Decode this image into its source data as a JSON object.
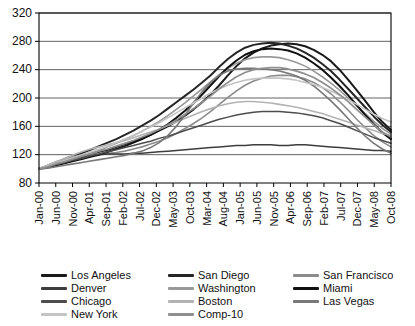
{
  "chart_data": {
    "type": "line",
    "title": "",
    "subtitle": "",
    "xlabel": "",
    "ylabel": "",
    "ylim": [
      80,
      320
    ],
    "ytick_step": 40,
    "yticks": [
      80,
      120,
      160,
      200,
      240,
      280,
      320
    ],
    "grid": true,
    "grid_axis": "y",
    "legend_position": "bottom",
    "legend_columns": 3,
    "x_tick_interval_months": 5,
    "x_start": "Jan-00",
    "x_end": "Oct-08",
    "xticks": [
      "Jan-00",
      "Jun-00",
      "Nov-00",
      "Apr-01",
      "Sep-01",
      "Feb-02",
      "Jul-02",
      "Dec-02",
      "May-03",
      "Oct-03",
      "Mar-04",
      "Aug-04",
      "Jan-05",
      "Jun-05",
      "Nov-05",
      "Apr-06",
      "Sep-06",
      "Feb-07",
      "Jul-07",
      "Dec-07",
      "May-08",
      "Oct-08"
    ],
    "series": [
      {
        "name": "Los Angeles",
        "color": "#1a1a1a",
        "width": 2.0,
        "values": [
          100,
          103,
          106,
          109,
          113,
          117,
          121,
          124,
          127,
          131,
          135,
          139,
          143,
          148,
          154,
          160,
          167,
          175,
          184,
          194,
          205,
          218,
          232,
          245,
          256,
          264,
          270,
          274,
          276,
          277,
          276,
          273,
          268,
          261,
          252,
          240,
          226,
          211,
          196,
          180,
          166,
          155
        ]
      },
      {
        "name": "San Diego",
        "color": "#262626",
        "width": 2.0,
        "values": [
          100,
          104,
          108,
          112,
          117,
          122,
          127,
          132,
          137,
          142,
          148,
          154,
          161,
          168,
          176,
          185,
          194,
          203,
          212,
          222,
          232,
          244,
          255,
          264,
          271,
          275,
          277,
          278,
          277,
          274,
          270,
          264,
          257,
          248,
          238,
          226,
          213,
          200,
          187,
          174,
          162,
          152
        ]
      },
      {
        "name": "San Francisco",
        "color": "#8c8c8c",
        "width": 1.6,
        "values": [
          100,
          105,
          110,
          114,
          117,
          119,
          120,
          121,
          122,
          123,
          125,
          128,
          131,
          135,
          139,
          144,
          150,
          157,
          164,
          172,
          181,
          191,
          201,
          210,
          218,
          224,
          228,
          231,
          232,
          232,
          230,
          227,
          222,
          215,
          206,
          195,
          183,
          170,
          158,
          147,
          138,
          131
        ]
      },
      {
        "name": "Denver",
        "color": "#3d3d3d",
        "width": 1.5,
        "values": [
          100,
          104,
          108,
          111,
          114,
          117,
          119,
          120,
          121,
          121,
          121,
          122,
          122,
          123,
          124,
          125,
          126,
          127,
          128,
          129,
          130,
          131,
          132,
          133,
          133,
          134,
          134,
          134,
          133,
          133,
          134,
          134,
          133,
          132,
          131,
          130,
          129,
          128,
          127,
          126,
          126,
          125
        ]
      },
      {
        "name": "Washington",
        "color": "#999999",
        "width": 1.6,
        "values": [
          100,
          103,
          106,
          110,
          114,
          118,
          122,
          126,
          131,
          136,
          141,
          147,
          153,
          160,
          167,
          175,
          184,
          193,
          203,
          213,
          223,
          233,
          242,
          249,
          254,
          257,
          258,
          258,
          257,
          254,
          250,
          245,
          238,
          230,
          221,
          211,
          200,
          189,
          178,
          167,
          157,
          149
        ]
      },
      {
        "name": "Miami",
        "color": "#111111",
        "width": 2.0,
        "values": [
          100,
          102,
          105,
          108,
          111,
          114,
          117,
          120,
          124,
          128,
          132,
          137,
          142,
          148,
          155,
          163,
          172,
          182,
          193,
          205,
          218,
          231,
          243,
          253,
          261,
          266,
          269,
          270,
          269,
          267,
          263,
          257,
          249,
          240,
          229,
          217,
          204,
          190,
          176,
          163,
          151,
          142
        ]
      },
      {
        "name": "Chicago",
        "color": "#4d4d4d",
        "width": 1.5,
        "values": [
          100,
          103,
          106,
          109,
          112,
          115,
          118,
          121,
          124,
          127,
          130,
          133,
          136,
          139,
          143,
          146,
          150,
          154,
          158,
          162,
          166,
          170,
          173,
          176,
          178,
          180,
          181,
          181,
          181,
          180,
          179,
          177,
          175,
          172,
          168,
          164,
          159,
          154,
          149,
          144,
          140,
          136
        ]
      },
      {
        "name": "Boston",
        "color": "#b3b3b3",
        "width": 1.6,
        "values": [
          100,
          105,
          110,
          115,
          120,
          124,
          128,
          131,
          134,
          137,
          140,
          144,
          148,
          152,
          156,
          161,
          166,
          171,
          176,
          181,
          185,
          189,
          192,
          194,
          195,
          195,
          194,
          193,
          191,
          189,
          187,
          184,
          181,
          178,
          174,
          170,
          166,
          162,
          158,
          154,
          150,
          147
        ]
      },
      {
        "name": "Las Vegas",
        "color": "#787878",
        "width": 1.6,
        "values": [
          100,
          101,
          103,
          105,
          107,
          109,
          111,
          113,
          115,
          117,
          119,
          122,
          125,
          130,
          137,
          147,
          160,
          176,
          193,
          209,
          222,
          232,
          238,
          241,
          242,
          242,
          241,
          240,
          238,
          235,
          231,
          225,
          217,
          207,
          196,
          184,
          171,
          158,
          146,
          136,
          128,
          122
        ]
      },
      {
        "name": "New York",
        "color": "#c4c4c4",
        "width": 1.6,
        "values": [
          100,
          104,
          108,
          112,
          116,
          120,
          124,
          128,
          132,
          137,
          142,
          147,
          153,
          159,
          165,
          172,
          179,
          186,
          193,
          200,
          207,
          213,
          218,
          222,
          225,
          227,
          228,
          228,
          228,
          227,
          225,
          222,
          219,
          215,
          210,
          204,
          198,
          191,
          184,
          177,
          171,
          166
        ]
      },
      {
        "name": "Comp-10",
        "color": "#8f8f8f",
        "width": 1.7,
        "values": [
          100,
          103,
          107,
          110,
          114,
          118,
          121,
          125,
          128,
          132,
          136,
          140,
          145,
          150,
          156,
          162,
          169,
          177,
          185,
          194,
          203,
          213,
          222,
          230,
          236,
          240,
          242,
          243,
          243,
          241,
          238,
          234,
          229,
          222,
          214,
          205,
          195,
          184,
          173,
          162,
          152,
          145
        ]
      }
    ]
  },
  "legend": {
    "columns": [
      {
        "items": [
          {
            "label": "Los Angeles",
            "color": "#1a1a1a",
            "width": 3.2
          },
          {
            "label": "Denver",
            "color": "#3d3d3d",
            "width": 2.6
          },
          {
            "label": "Chicago",
            "color": "#4d4d4d",
            "width": 2.6
          },
          {
            "label": "New York",
            "color": "#c4c4c4",
            "width": 2.6
          }
        ]
      },
      {
        "items": [
          {
            "label": "San Diego",
            "color": "#262626",
            "width": 3.2
          },
          {
            "label": "Washington",
            "color": "#999999",
            "width": 2.6
          },
          {
            "label": "Boston",
            "color": "#b3b3b3",
            "width": 2.6
          },
          {
            "label": "Comp-10",
            "color": "#8f8f8f",
            "width": 2.6
          }
        ]
      },
      {
        "items": [
          {
            "label": "San Francisco",
            "color": "#8c8c8c",
            "width": 2.6
          },
          {
            "label": "Miami",
            "color": "#111111",
            "width": 3.2
          },
          {
            "label": "Las Vegas",
            "color": "#787878",
            "width": 2.6
          }
        ]
      }
    ]
  }
}
